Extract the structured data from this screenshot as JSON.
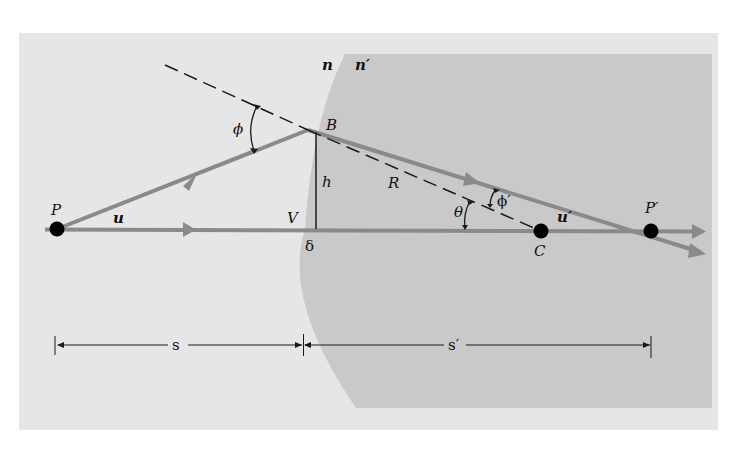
{
  "diagram": {
    "type": "optics-refraction-spherical-surface",
    "colors": {
      "page_background": "#ffffff",
      "panel_background": "#e6e6e6",
      "medium_fill": "#c9c9c9",
      "ray_color": "#8a8a8a",
      "line_color": "#1a1a1a",
      "point_color": "#000000"
    },
    "labels": {
      "n": "n",
      "n_prime": "n′",
      "B": "B",
      "phi": "ϕ",
      "h": "h",
      "R": "R",
      "P": "P",
      "u": "u",
      "V": "V",
      "theta": "θ",
      "phi_prime": "ϕ′",
      "C": "C",
      "u_prime": "u′",
      "P_prime": "P′",
      "delta": "δ",
      "s": "s",
      "s_prime": "s′"
    },
    "points": [
      {
        "name": "P",
        "role": "object point"
      },
      {
        "name": "B",
        "role": "ray incidence point on surface"
      },
      {
        "name": "V",
        "role": "vertex of surface"
      },
      {
        "name": "C",
        "role": "center of curvature"
      },
      {
        "name": "P′",
        "role": "image point"
      }
    ],
    "dimensions": [
      {
        "label": "s",
        "from": "P",
        "to": "V"
      },
      {
        "label": "s′",
        "from": "V",
        "to": "P′"
      }
    ]
  }
}
